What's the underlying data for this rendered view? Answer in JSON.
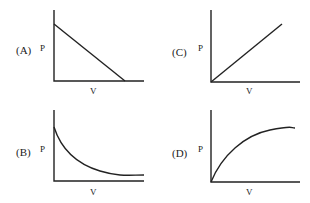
{
  "graphs": [
    {
      "option": "(A)",
      "ylabel": "P",
      "xlabel": "V",
      "shape": "straight line decreasing from P-axis intercept to V-axis intercept"
    },
    {
      "option": "(B)",
      "ylabel": "P",
      "xlabel": "V",
      "shape": "hyperbolic decay curve approaching V-axis asymptotically"
    },
    {
      "option": "(C)",
      "ylabel": "P",
      "xlabel": "V",
      "shape": "straight line increasing from origin"
    },
    {
      "option": "(D)",
      "ylabel": "P",
      "xlabel": "V",
      "shape": "concave-down curve rising from origin and leveling off"
    }
  ],
  "colors": {
    "ink": "#222222",
    "background": "#ffffff"
  }
}
